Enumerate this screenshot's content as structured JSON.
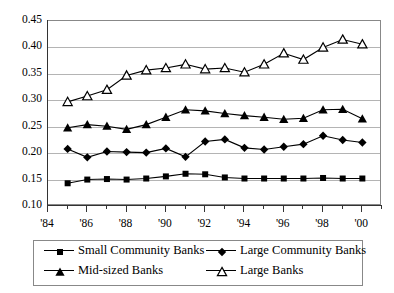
{
  "chart_data": {
    "type": "line",
    "title": "",
    "xlabel": "",
    "ylabel": "",
    "x": [
      1985,
      1986,
      1987,
      1988,
      1989,
      1990,
      1991,
      1992,
      1993,
      1994,
      1995,
      1996,
      1997,
      1998,
      1999,
      2000
    ],
    "xlim": [
      1984,
      2001
    ],
    "ylim": [
      0.1,
      0.45
    ],
    "ytick_labels": [
      "0.45",
      "0.40",
      "0.35",
      "0.30",
      "0.25",
      "0.20",
      "0.15",
      "0.10"
    ],
    "ytick_values": [
      0.45,
      0.4,
      0.35,
      0.3,
      0.25,
      0.2,
      0.15,
      0.1
    ],
    "xtick_labels": [
      "'84",
      "'86",
      "'88",
      "'90",
      "'92",
      "'94",
      "'96",
      "'98",
      "'00"
    ],
    "xtick_values": [
      1984,
      1986,
      1988,
      1990,
      1992,
      1994,
      1996,
      1998,
      2000
    ],
    "grid": true,
    "legend_position": "bottom",
    "series": [
      {
        "name": "Small Community Banks",
        "marker": "filled-square",
        "color": "#000000",
        "values": [
          0.143,
          0.15,
          0.151,
          0.15,
          0.152,
          0.156,
          0.161,
          0.16,
          0.154,
          0.152,
          0.152,
          0.152,
          0.152,
          0.153,
          0.152,
          0.152
        ]
      },
      {
        "name": "Large Community Banks",
        "marker": "filled-diamond",
        "color": "#000000",
        "values": [
          0.208,
          0.192,
          0.203,
          0.202,
          0.201,
          0.209,
          0.193,
          0.222,
          0.226,
          0.21,
          0.207,
          0.212,
          0.217,
          0.233,
          0.225,
          0.22
        ]
      },
      {
        "name": "Mid-sized Banks",
        "marker": "filled-triangle",
        "color": "#000000",
        "values": [
          0.248,
          0.254,
          0.251,
          0.245,
          0.254,
          0.268,
          0.282,
          0.28,
          0.275,
          0.271,
          0.268,
          0.264,
          0.266,
          0.282,
          0.283,
          0.265
        ]
      },
      {
        "name": "Large Banks",
        "marker": "open-triangle",
        "color": "#000000",
        "values": [
          0.297,
          0.308,
          0.32,
          0.347,
          0.357,
          0.361,
          0.368,
          0.359,
          0.361,
          0.353,
          0.368,
          0.389,
          0.377,
          0.4,
          0.415,
          0.406
        ]
      }
    ]
  },
  "legend": {
    "items": [
      {
        "label": "Small Community Banks",
        "marker": "filled-square"
      },
      {
        "label": "Large Community Banks",
        "marker": "filled-diamond"
      },
      {
        "label": "Mid-sized Banks",
        "marker": "filled-triangle"
      },
      {
        "label": "Large Banks",
        "marker": "open-triangle"
      }
    ]
  }
}
